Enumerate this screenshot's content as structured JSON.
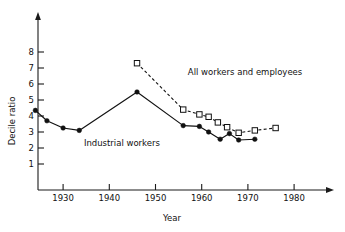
{
  "chart_data": {
    "type": "line",
    "title": "",
    "xlabel": "Year",
    "ylabel": "Decile ratio",
    "xlim": [
      1923,
      1990
    ],
    "ylim": [
      0,
      8.8
    ],
    "xticks": [
      1930,
      1940,
      1950,
      1960,
      1970,
      1980
    ],
    "xticklabels": [
      "1930",
      "1940",
      "1950",
      "1960",
      "1970",
      "1980"
    ],
    "yticks": [
      1,
      2,
      3,
      4,
      5,
      6,
      7,
      8
    ],
    "yticklabels": [
      "1",
      "2",
      "3",
      "4",
      "5",
      "6",
      "7",
      "8"
    ],
    "grid": false,
    "legend_position": "inline-annotation",
    "series": [
      {
        "name": "Industrial workers",
        "marker": "filled-circle",
        "linestyle": "solid",
        "color": "#111111",
        "x": [
          1924,
          1926.5,
          1930,
          1933.5,
          1946,
          1956,
          1959.5,
          1961.5,
          1964,
          1966,
          1968,
          1971.5
        ],
        "y": [
          4.35,
          3.7,
          3.25,
          3.1,
          5.5,
          3.4,
          3.35,
          3.0,
          2.55,
          2.9,
          2.5,
          2.55
        ]
      },
      {
        "name": "All workers and employees",
        "marker": "open-square",
        "linestyle": "dashed",
        "color": "#111111",
        "x": [
          1946,
          1956,
          1959.5,
          1961.5,
          1963.5,
          1965.5,
          1968,
          1971.5,
          1976
        ],
        "y": [
          7.3,
          4.4,
          4.1,
          3.95,
          3.6,
          3.3,
          2.95,
          3.1,
          3.25
        ]
      }
    ],
    "annotations": [
      {
        "id": "annotation-all-workers",
        "text": "All workers and employees",
        "x": 1957,
        "y": 6.55
      },
      {
        "id": "annotation-industrial-workers",
        "text": "Industrial workers",
        "x": 1934.5,
        "y": 2.15
      }
    ]
  },
  "axes": {
    "y_axis_title": "Decile ratio",
    "x_axis_title": "Year"
  }
}
